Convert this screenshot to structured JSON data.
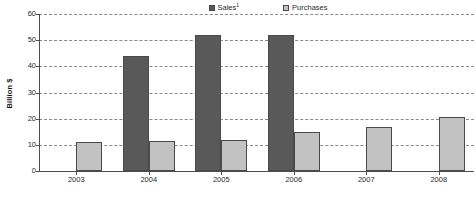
{
  "chart_data": {
    "type": "bar",
    "title": "",
    "subtitle": "",
    "xlabel": "",
    "ylabel": "Billion $",
    "ylim": [
      0,
      60
    ],
    "ytick_step": 10,
    "yticks": [
      "0",
      "10",
      "20",
      "30",
      "40",
      "50",
      "60"
    ],
    "grid": true,
    "grid_style": "dashed-horizontal",
    "legend_position": "top-center",
    "categories": [
      "2003",
      "2004",
      "2005",
      "2006",
      "2007",
      "2008"
    ],
    "series": [
      {
        "name": "Sales",
        "name_superscript": "1",
        "color": "#595959",
        "values": [
          null,
          44,
          52,
          52,
          null,
          null
        ]
      },
      {
        "name": "Purchases",
        "color": "#c2c2c2",
        "values": [
          11,
          11.3,
          11.8,
          15,
          17,
          20.5
        ]
      }
    ]
  },
  "legend": {
    "entries": [
      {
        "label": "Sales",
        "superscript": "1"
      },
      {
        "label": "Purchases",
        "superscript": ""
      }
    ]
  },
  "axes": {
    "y_title": "Billion $",
    "y_ticks": [
      "60",
      "50",
      "40",
      "30",
      "20",
      "10",
      "0"
    ],
    "x_ticks": [
      "2003",
      "2004",
      "2005",
      "2006",
      "2007",
      "2008"
    ]
  }
}
